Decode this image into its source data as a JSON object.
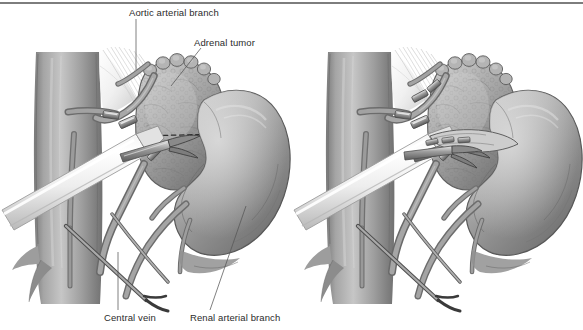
{
  "figure": {
    "kind": "medical-illustration",
    "panel_count": 2,
    "style": "grayscale pen-and-ink with wash shading",
    "background_color": "#ffffff",
    "rule_color": "#7d7d7d",
    "text_color": "#2b2b2b"
  },
  "labels": {
    "aortic_arterial_branch": "Aortic arterial branch",
    "adrenal_tumor": "Adrenal tumor",
    "central_vein": "Central vein",
    "renal_arterial_branch": "Renal arterial branch"
  },
  "panels": [
    {
      "id": "left",
      "caption": "",
      "structures": [
        "inferior vena cava",
        "adrenal tumor",
        "kidney",
        "central vein with clips",
        "aortic arterial branch",
        "renal arterial branch",
        "laparoscopic dissector",
        "laparoscopic retractor shaft",
        "vascular clips",
        "dashed resection line"
      ]
    },
    {
      "id": "right",
      "caption": "",
      "structures": [
        "inferior vena cava",
        "divided adrenal tumor",
        "kidney",
        "clipped central vein",
        "clipped aortic arterial branch",
        "renal arterial branch",
        "laparoscopic grasper",
        "laparoscopic retractor shaft",
        "vascular clips"
      ]
    }
  ]
}
